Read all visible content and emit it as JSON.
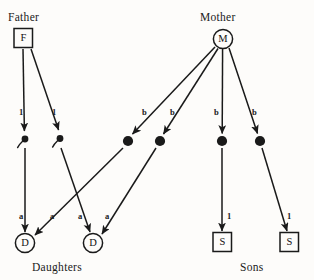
{
  "diagram": {
    "type": "genetic-inheritance-pedigree",
    "background_color": "#fdfcfa",
    "ink_color": "#1a1a1a",
    "titles": {
      "father": "Father",
      "mother": "Mother"
    },
    "captions": {
      "daughters": "Daughters",
      "sons": "Sons"
    },
    "parents": [
      {
        "id": "father",
        "glyph": "F",
        "shape": "square",
        "cx": 23,
        "cy": 38
      },
      {
        "id": "mother",
        "glyph": "M",
        "shape": "circle",
        "cx": 223,
        "cy": 39
      }
    ],
    "gametes": [
      {
        "id": "sperm-1",
        "kind": "sperm",
        "cx": 25,
        "cy": 139
      },
      {
        "id": "sperm-2",
        "kind": "sperm",
        "cx": 60,
        "cy": 138
      },
      {
        "id": "ovum-1",
        "kind": "ovum",
        "cx": 128,
        "cy": 141
      },
      {
        "id": "ovum-2",
        "kind": "ovum",
        "cx": 160,
        "cy": 141
      },
      {
        "id": "ovum-3",
        "kind": "ovum",
        "cx": 222,
        "cy": 141
      },
      {
        "id": "ovum-4",
        "kind": "ovum",
        "cx": 260,
        "cy": 141
      }
    ],
    "offspring": [
      {
        "id": "daughter-1",
        "glyph": "D",
        "shape": "circle",
        "cx": 25,
        "cy": 243
      },
      {
        "id": "daughter-2",
        "glyph": "D",
        "shape": "circle",
        "cx": 93,
        "cy": 243
      },
      {
        "id": "son-1",
        "glyph": "S",
        "shape": "square",
        "cx": 222,
        "cy": 242
      },
      {
        "id": "son-2",
        "glyph": "S",
        "shape": "square",
        "cx": 289,
        "cy": 242
      }
    ],
    "edges": [
      {
        "id": "father-to-sperm-1",
        "from": "father",
        "to": "sperm-1",
        "label": "1",
        "label_x": 19,
        "label_y": 108
      },
      {
        "id": "father-to-sperm-2",
        "from": "father",
        "to": "sperm-2",
        "label": "1",
        "label_x": 52,
        "label_y": 108
      },
      {
        "id": "mother-to-ovum-1",
        "from": "mother",
        "to": "ovum-1",
        "label": "b",
        "label_x": 142,
        "label_y": 108
      },
      {
        "id": "mother-to-ovum-2",
        "from": "mother",
        "to": "ovum-2",
        "label": "b",
        "label_x": 170,
        "label_y": 108
      },
      {
        "id": "mother-to-ovum-3",
        "from": "mother",
        "to": "ovum-3",
        "label": "b",
        "label_x": 214,
        "label_y": 108
      },
      {
        "id": "mother-to-ovum-4",
        "from": "mother",
        "to": "ovum-4",
        "label": "b",
        "label_x": 252,
        "label_y": 108
      },
      {
        "id": "sperm-1-to-daughter-1",
        "from": "sperm-1",
        "to": "daughter-1",
        "label": "a",
        "label_x": 19,
        "label_y": 212
      },
      {
        "id": "sperm-2-to-daughter-2",
        "from": "sperm-2",
        "to": "daughter-2",
        "label": "a",
        "label_x": 78,
        "label_y": 212
      },
      {
        "id": "ovum-1-to-daughter-1",
        "from": "ovum-1",
        "to": "daughter-1",
        "label": "a",
        "label_x": 50,
        "label_y": 212
      },
      {
        "id": "ovum-2-to-daughter-2",
        "from": "ovum-2",
        "to": "daughter-2",
        "label": "a",
        "label_x": 105,
        "label_y": 212
      },
      {
        "id": "ovum-3-to-son-1",
        "from": "ovum-3",
        "to": "son-1",
        "label": "1",
        "label_x": 227,
        "label_y": 212
      },
      {
        "id": "ovum-4-to-son-2",
        "from": "ovum-4",
        "to": "son-2",
        "label": "1",
        "label_x": 287,
        "label_y": 212
      }
    ]
  }
}
